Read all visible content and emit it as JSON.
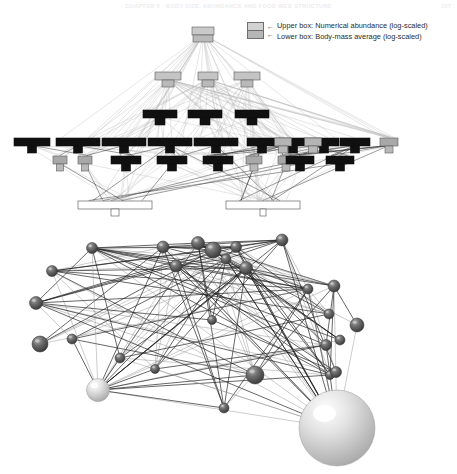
{
  "page": {
    "running_head": "CHAPTER 5 · BODY SIZE, ABUNDANCE AND FOOD WEB STRUCTURE",
    "folio": "107",
    "background": "#ffffff"
  },
  "legend": {
    "name": "box-legend",
    "swatch_icon": "stacked-two-box-icon",
    "arrow_icon": "left-arrow-icon",
    "entries": [
      {
        "arrow": "←",
        "label": "Upper box: Numerical abundance (log-scaled)"
      },
      {
        "arrow": "←",
        "label": "Lower box: Body-mass average (log-scaled)"
      }
    ]
  },
  "panels": [
    {
      "id": "panel-top",
      "name": "box-food-web-panel",
      "caption": "",
      "type": "hierarchical-box-food-web"
    },
    {
      "id": "panel-bottom",
      "name": "sphere-food-web-panel",
      "caption": "",
      "type": "three-dimensional-sphere-network"
    }
  ],
  "colors": {
    "box_dark": "#111111",
    "box_mid": "#9c9c9c",
    "box_light": "#d2d2d2",
    "box_empty": "#ffffff",
    "box_stroke": "#5a5a5a",
    "link_light": "#b9b9b9",
    "link_dark": "#262626",
    "sphere_dark": "#5b5b5b",
    "sphere_light": "#d9d9d9",
    "header_text": "#ececed"
  },
  "chart_data": {
    "type": "diagram",
    "xlabel": "",
    "ylabel": "Trophic position (increasing upward)",
    "legend_position": "top-right",
    "grid": false,
    "top_panel": {
      "type": "hierarchical-box-food-web",
      "encoding": {
        "upper_box_width": "Numerical abundance (log-scaled)",
        "lower_box_width": "Body-mass average (log-scaled)",
        "vertical_position": "trophic level",
        "fill_shade": "trophic group"
      },
      "trophic_levels": [
        {
          "level": 5,
          "name": "top-predator",
          "y": 27,
          "node_count": 1,
          "nodes": [
            {
              "x": 203,
              "abundance_w": 22,
              "mass_w": 20,
              "fill": "#c9c9c9"
            }
          ]
        },
        {
          "level": 4,
          "name": "upper-predators",
          "y": 72,
          "node_count": 3,
          "nodes": [
            {
              "x": 168,
              "abundance_w": 26,
              "mass_w": 12,
              "fill": "#c4c4c4"
            },
            {
              "x": 208,
              "abundance_w": 20,
              "mass_w": 12,
              "fill": "#c4c4c4"
            },
            {
              "x": 247,
              "abundance_w": 26,
              "mass_w": 12,
              "fill": "#c4c4c4"
            }
          ]
        },
        {
          "level": 3,
          "name": "mid-predators-dark",
          "y": 110,
          "node_count": 3,
          "nodes": [
            {
              "x": 160,
              "abundance_w": 34,
              "mass_w": 10,
              "fill": "#101010"
            },
            {
              "x": 205,
              "abundance_w": 34,
              "mass_w": 10,
              "fill": "#101010"
            },
            {
              "x": 252,
              "abundance_w": 34,
              "mass_w": 10,
              "fill": "#101010"
            }
          ]
        },
        {
          "level": 2,
          "name": "consumers-row-upper",
          "y": 138,
          "node_count": 12,
          "nodes": [
            {
              "x": 32,
              "abundance_w": 36,
              "mass_w": 9,
              "fill": "#101010"
            },
            {
              "x": 78,
              "abundance_w": 44,
              "mass_w": 9,
              "fill": "#101010"
            },
            {
              "x": 124,
              "abundance_w": 44,
              "mass_w": 9,
              "fill": "#101010"
            },
            {
              "x": 170,
              "abundance_w": 44,
              "mass_w": 9,
              "fill": "#101010"
            },
            {
              "x": 216,
              "abundance_w": 44,
              "mass_w": 9,
              "fill": "#101010"
            },
            {
              "x": 262,
              "abundance_w": 30,
              "mass_w": 9,
              "fill": "#101010"
            },
            {
              "x": 293,
              "abundance_w": 30,
              "mass_w": 9,
              "fill": "#101010"
            },
            {
              "x": 324,
              "abundance_w": 30,
              "mass_w": 9,
              "fill": "#101010"
            },
            {
              "x": 355,
              "abundance_w": 30,
              "mass_w": 9,
              "fill": "#101010"
            },
            {
              "x": 389,
              "abundance_w": 18,
              "mass_w": 8,
              "fill": "#a8a8a8"
            },
            {
              "x": 283,
              "abundance_w": 17,
              "mass_w": 9,
              "fill": "#b4b4b4"
            },
            {
              "x": 313,
              "abundance_w": 17,
              "mass_w": 9,
              "fill": "#b4b4b4"
            }
          ]
        },
        {
          "level": 1,
          "name": "consumers-row-lower",
          "y": 156,
          "node_count": 9,
          "nodes": [
            {
              "x": 85,
              "abundance_w": 14,
              "mass_w": 7,
              "fill": "#a8a8a8"
            },
            {
              "x": 126,
              "abundance_w": 30,
              "mass_w": 9,
              "fill": "#101010"
            },
            {
              "x": 172,
              "abundance_w": 30,
              "mass_w": 9,
              "fill": "#101010"
            },
            {
              "x": 218,
              "abundance_w": 30,
              "mass_w": 9,
              "fill": "#101010"
            },
            {
              "x": 254,
              "abundance_w": 16,
              "mass_w": 8,
              "fill": "#a8a8a8"
            },
            {
              "x": 286,
              "abundance_w": 16,
              "mass_w": 8,
              "fill": "#a8a8a8"
            },
            {
              "x": 300,
              "abundance_w": 28,
              "mass_w": 9,
              "fill": "#101010"
            },
            {
              "x": 340,
              "abundance_w": 28,
              "mass_w": 9,
              "fill": "#101010"
            },
            {
              "x": 60,
              "abundance_w": 14,
              "mass_w": 7,
              "fill": "#a8a8a8"
            }
          ]
        },
        {
          "level": 0,
          "name": "basal-resources",
          "y": 201,
          "node_count": 2,
          "nodes": [
            {
              "x": 115,
              "abundance_w": 74,
              "mass_w": 8,
              "fill": "#ffffff"
            },
            {
              "x": 263,
              "abundance_w": 74,
              "mass_w": 6,
              "fill": "#ffffff"
            }
          ]
        }
      ],
      "link_count_estimate": 260
    },
    "bottom_panel": {
      "type": "three-dimensional-sphere-network",
      "encoding": {
        "sphere_radius": "Body mass (log-scaled)",
        "sphere_shade": "Trophic group (dark = consumer, light = basal)",
        "position": "3-D layout of the same web"
      },
      "node_count": 28,
      "link_count_estimate": 150,
      "nodes": [
        {
          "id": 1,
          "x": 92,
          "y": 248,
          "r": 5.5,
          "shade": "dark"
        },
        {
          "id": 2,
          "x": 163,
          "y": 247,
          "r": 6.0,
          "shade": "dark"
        },
        {
          "id": 3,
          "x": 198,
          "y": 243,
          "r": 6.5,
          "shade": "dark"
        },
        {
          "id": 4,
          "x": 213,
          "y": 250,
          "r": 8.0,
          "shade": "dark"
        },
        {
          "id": 5,
          "x": 236,
          "y": 247,
          "r": 5.5,
          "shade": "dark"
        },
        {
          "id": 6,
          "x": 282,
          "y": 240,
          "r": 6.0,
          "shade": "dark"
        },
        {
          "id": 7,
          "x": 226,
          "y": 259,
          "r": 5.0,
          "shade": "dark"
        },
        {
          "id": 8,
          "x": 176,
          "y": 266,
          "r": 6.0,
          "shade": "dark"
        },
        {
          "id": 9,
          "x": 246,
          "y": 268,
          "r": 6.5,
          "shade": "dark"
        },
        {
          "id": 10,
          "x": 52,
          "y": 271,
          "r": 5.5,
          "shade": "dark"
        },
        {
          "id": 11,
          "x": 36,
          "y": 303,
          "r": 6.5,
          "shade": "dark"
        },
        {
          "id": 12,
          "x": 308,
          "y": 289,
          "r": 5.0,
          "shade": "dark"
        },
        {
          "id": 13,
          "x": 334,
          "y": 286,
          "r": 6.0,
          "shade": "dark"
        },
        {
          "id": 14,
          "x": 357,
          "y": 325,
          "r": 7.0,
          "shade": "dark"
        },
        {
          "id": 15,
          "x": 340,
          "y": 340,
          "r": 5.0,
          "shade": "dark"
        },
        {
          "id": 16,
          "x": 336,
          "y": 372,
          "r": 5.5,
          "shade": "dark"
        },
        {
          "id": 17,
          "x": 330,
          "y": 375,
          "r": 4.5,
          "shade": "dark"
        },
        {
          "id": 18,
          "x": 40,
          "y": 344,
          "r": 8.0,
          "shade": "dark"
        },
        {
          "id": 19,
          "x": 72,
          "y": 339,
          "r": 5.0,
          "shade": "dark"
        },
        {
          "id": 20,
          "x": 155,
          "y": 369,
          "r": 4.5,
          "shade": "dark"
        },
        {
          "id": 21,
          "x": 224,
          "y": 408,
          "r": 5.0,
          "shade": "dark"
        },
        {
          "id": 22,
          "x": 255,
          "y": 375,
          "r": 9.0,
          "shade": "dark"
        },
        {
          "id": 23,
          "x": 326,
          "y": 345,
          "r": 5.5,
          "shade": "dark"
        },
        {
          "id": 24,
          "x": 98,
          "y": 390,
          "r": 11.5,
          "shade": "light"
        },
        {
          "id": 25,
          "x": 329,
          "y": 314,
          "r": 5.0,
          "shade": "dark"
        },
        {
          "id": 26,
          "x": 120,
          "y": 358,
          "r": 5.0,
          "shade": "dark"
        },
        {
          "id": 27,
          "x": 212,
          "y": 320,
          "r": 4.5,
          "shade": "dark"
        },
        {
          "id": 28,
          "x": 337,
          "y": 428,
          "r": 38.0,
          "shade": "light"
        }
      ]
    }
  }
}
